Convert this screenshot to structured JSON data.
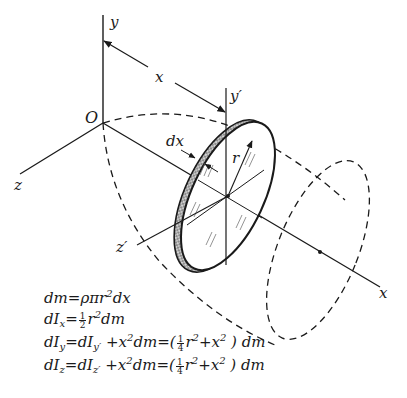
{
  "figure": {
    "type": "diagram",
    "labels": {
      "y_axis": "y",
      "x_dim": "x",
      "y_prime_axis": "y′",
      "origin": "O",
      "dx": "dx",
      "radius": "r",
      "z_axis": "z",
      "z_prime_axis": "z′",
      "x_axis": "x"
    },
    "colors": {
      "ink": "#1a1a1a",
      "background": "#ffffff"
    }
  },
  "equations": [
    {
      "lhs": "dm",
      "rhs": "ρπr²dx",
      "parts": {
        "a": "dm",
        "eq": "=",
        "b": "ρπr",
        "b_sup": "2",
        "c": "dx"
      }
    },
    {
      "lhs": "dIx",
      "rhs": "½ r²dm",
      "parts": {
        "a": "dI",
        "a_sub": "x",
        "eq": "=",
        "num": "1",
        "den": "2",
        "b": "r",
        "b_sup": "2",
        "c": "dm"
      }
    },
    {
      "lhs": "dIy",
      "rhs": "dIy′ + x²dm = (¼r² + x²) dm",
      "parts": {
        "a": "dI",
        "a_sub": "y",
        "eq": "=",
        "b": "dI",
        "b_sub": "y′",
        "c": " +x",
        "c_sup": "2",
        "d": "dm=(",
        "num": "1",
        "den": "4",
        "e": "r",
        "e_sup": "2",
        "f": "+x",
        "f_sup": "2",
        "g": " ) dm"
      }
    },
    {
      "lhs": "dIz",
      "rhs": "dIz′ + x²dm = (¼r² + x²) dm",
      "parts": {
        "a": "dI",
        "a_sub": "z",
        "eq": "=",
        "b": "dI",
        "b_sub": "z′",
        "c": " +x",
        "c_sup": "2",
        "d": "dm=(",
        "num": "1",
        "den": "4",
        "e": "r",
        "e_sup": "2",
        "f": "+x",
        "f_sup": "2",
        "g": " ) dm"
      }
    }
  ]
}
